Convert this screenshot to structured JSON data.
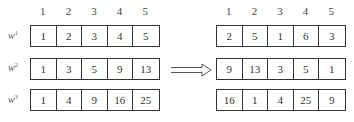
{
  "diagram": {
    "left": {
      "column_headers": [
        "1",
        "2",
        "3",
        "4",
        "5"
      ],
      "rows": [
        {
          "label": "w",
          "superscript": "1",
          "values": [
            "1",
            "2",
            "3",
            "4",
            "5"
          ]
        },
        {
          "label": "w",
          "superscript": "2",
          "values": [
            "1",
            "3",
            "5",
            "9",
            "13"
          ]
        },
        {
          "label": "w",
          "superscript": "3",
          "values": [
            "1",
            "4",
            "9",
            "16",
            "25"
          ]
        }
      ]
    },
    "arrow": {
      "icon": "double-arrow-right-icon",
      "direction": "right"
    },
    "right": {
      "column_headers": [
        "1",
        "2",
        "3",
        "4",
        "5"
      ],
      "rows": [
        {
          "values": [
            "2",
            "5",
            "1",
            "6",
            "3"
          ]
        },
        {
          "values": [
            "9",
            "13",
            "3",
            "5",
            "1"
          ]
        },
        {
          "values": [
            "16",
            "1",
            "4",
            "25",
            "9"
          ]
        }
      ]
    }
  }
}
